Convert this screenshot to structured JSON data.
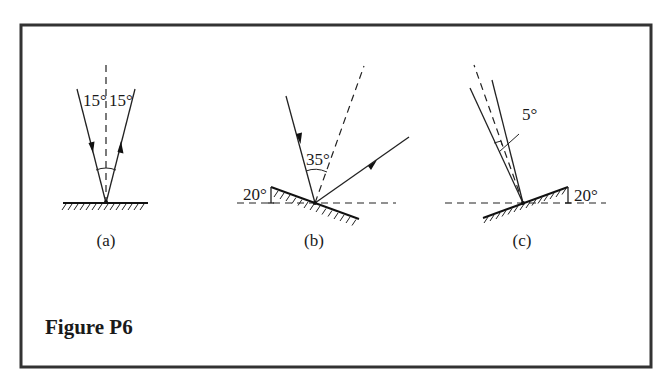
{
  "figure": {
    "caption": "Figure P6",
    "panels": [
      {
        "id": "a",
        "label": "(a)",
        "mirror_tilt_deg": 0,
        "incident_angle_label": "15°",
        "reflected_angle_label": "15°",
        "description": "Ray incident at 15° to normal on horizontal mirror, reflected at 15°"
      },
      {
        "id": "b",
        "label": "(b)",
        "mirror_tilt_label": "20°",
        "angle_label": "35°",
        "description": "Mirror tilted 20° below horizontal; incident ray makes 35° with the normal; reflected ray shown"
      },
      {
        "id": "c",
        "label": "(c)",
        "mirror_tilt_label": "20°",
        "angle_label": "5°",
        "description": "Mirror tilted 20° above horizontal; incident and reflected rays each 5° from the normal"
      }
    ]
  },
  "colors": {
    "line": "#222222",
    "frame": "#333333",
    "background": "#ffffff"
  }
}
